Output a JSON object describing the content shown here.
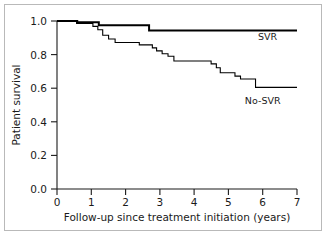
{
  "chart_data": {
    "type": "line",
    "subtype": "kaplan-meier-step",
    "title": "",
    "xlabel": "Follow-up since treatment initiation (years)",
    "ylabel": "Patient survival",
    "xlim": [
      0,
      7.35
    ],
    "ylim": [
      0.0,
      1.0
    ],
    "xticks": [
      0,
      1,
      2,
      3,
      4,
      5,
      6,
      7
    ],
    "xticklabels": [
      "0",
      "1",
      "2",
      "3",
      "4",
      "5",
      "6",
      "7"
    ],
    "yticks": [
      0.0,
      0.2,
      0.4,
      0.6,
      0.8,
      1.0
    ],
    "yticklabels": [
      "0.0",
      "0.2",
      "0.4",
      "0.6",
      "0.8",
      "1.0"
    ],
    "grid": false,
    "legend_position": "inline-right-of-curve",
    "series": [
      {
        "name": "SVR",
        "label": "SVR",
        "color": "#000000",
        "linewidth": 2.0,
        "x": [
          0.0,
          0.62,
          0.62,
          1.28,
          1.28,
          2.82,
          2.82,
          7.35
        ],
        "y": [
          1.0,
          1.0,
          0.993,
          0.993,
          0.975,
          0.975,
          0.943,
          0.943
        ],
        "label_x": 6.45,
        "label_y": 0.885,
        "final_value": 0.943
      },
      {
        "name": "No-SVR",
        "label": "No-SVR",
        "color": "#000000",
        "linewidth": 1.1,
        "x": [
          0.0,
          0.6,
          0.6,
          1.1,
          1.1,
          1.25,
          1.25,
          1.4,
          1.4,
          1.58,
          1.58,
          1.78,
          1.78,
          2.52,
          2.52,
          2.92,
          2.92,
          3.05,
          3.05,
          3.22,
          3.22,
          3.4,
          3.4,
          3.58,
          3.58,
          4.72,
          4.72,
          4.88,
          4.88,
          5.0,
          5.0,
          5.45,
          5.45,
          5.62,
          5.62,
          6.08,
          6.08,
          7.35
        ],
        "y": [
          1.0,
          1.0,
          0.986,
          0.986,
          0.968,
          0.968,
          0.948,
          0.948,
          0.915,
          0.915,
          0.893,
          0.893,
          0.872,
          0.872,
          0.858,
          0.858,
          0.84,
          0.84,
          0.822,
          0.822,
          0.805,
          0.805,
          0.79,
          0.79,
          0.762,
          0.762,
          0.745,
          0.745,
          0.722,
          0.722,
          0.692,
          0.692,
          0.672,
          0.672,
          0.655,
          0.655,
          0.605,
          0.605
        ],
        "label_x": 6.3,
        "label_y": 0.505,
        "final_value": 0.605
      }
    ]
  }
}
